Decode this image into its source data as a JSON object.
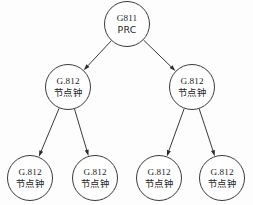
{
  "diagram": {
    "background_color": "#fdfdfd",
    "stroke_color": "#3a3a3a",
    "text_color": "#1d1d1d",
    "nodes": [
      {
        "id": "root",
        "line1": "G811",
        "line2": "PRC",
        "cx": 127,
        "cy": 24,
        "r": 22.5,
        "level": 0
      },
      {
        "id": "mid-left",
        "line1": "G.812",
        "line2": "节点钟",
        "cx": 68,
        "cy": 87,
        "r": 22.5,
        "level": 1
      },
      {
        "id": "mid-right",
        "line1": "G.812",
        "line2": "节点钟",
        "cx": 192,
        "cy": 87,
        "r": 22.5,
        "level": 1
      },
      {
        "id": "leaf-1",
        "line1": "G.812",
        "line2": "节点钟",
        "cx": 30,
        "cy": 178,
        "r": 22.5,
        "level": 2
      },
      {
        "id": "leaf-2",
        "line1": "G.812",
        "line2": "节点钟",
        "cx": 95,
        "cy": 178,
        "r": 22.5,
        "level": 2
      },
      {
        "id": "leaf-3",
        "line1": "G.812",
        "line2": "节点钟",
        "cx": 159,
        "cy": 178,
        "r": 22.5,
        "level": 2
      },
      {
        "id": "leaf-4",
        "line1": "G.812",
        "line2": "节点钟",
        "cx": 222,
        "cy": 178,
        "r": 22.5,
        "level": 2
      }
    ],
    "edges": [
      {
        "id": "edge-root-mid-left",
        "from": "root",
        "to": "mid-left",
        "arrow": true
      },
      {
        "id": "edge-root-mid-right",
        "from": "root",
        "to": "mid-right",
        "arrow": true
      },
      {
        "id": "edge-mid-left-leaf-1",
        "from": "mid-left",
        "to": "leaf-1",
        "arrow": true
      },
      {
        "id": "edge-mid-left-leaf-2",
        "from": "mid-left",
        "to": "leaf-2",
        "arrow": true
      },
      {
        "id": "edge-mid-right-leaf-3",
        "from": "mid-right",
        "to": "leaf-3",
        "arrow": true
      },
      {
        "id": "edge-mid-right-leaf-4",
        "from": "mid-right",
        "to": "leaf-4",
        "arrow": true
      }
    ]
  }
}
